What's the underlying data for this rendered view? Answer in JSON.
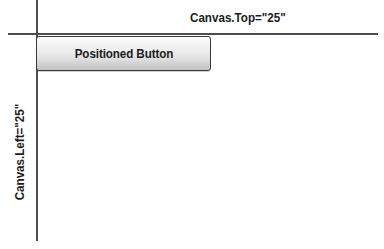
{
  "figure": {
    "width": 384,
    "height": 249,
    "background_color": "#ffffff",
    "line_color": "#4d4d4d",
    "text_color": "#1b1b1b"
  },
  "annotations": {
    "top_label": "Canvas.Top=\"25\"",
    "left_label": "Canvas.Left=\"25\""
  },
  "button": {
    "label": "Positioned Button",
    "border_color": "#3a3a3a",
    "gradient_top_color": "#fdfdfd",
    "gradient_bottom_color": "#c2c2c2"
  },
  "axes": {
    "vertical_name": "canvas-left-axis",
    "horizontal_name": "canvas-top-axis"
  }
}
